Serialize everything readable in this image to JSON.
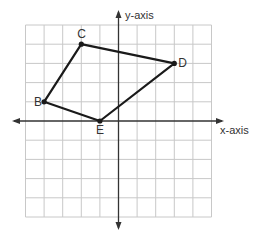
{
  "diagram": {
    "type": "coordinate-plane-polygon",
    "grid": {
      "x_min": -5,
      "x_max": 5,
      "y_min": -5,
      "y_max": 5,
      "step": 1
    },
    "axes": {
      "x_label": "x-axis",
      "y_label": "y-axis"
    },
    "points": [
      {
        "name": "C",
        "x": -2,
        "y": 4
      },
      {
        "name": "D",
        "x": 3,
        "y": 3
      },
      {
        "name": "E",
        "x": -1,
        "y": 0
      },
      {
        "name": "B",
        "x": -4,
        "y": 1
      }
    ],
    "polygon_order": [
      "C",
      "D",
      "E",
      "B"
    ],
    "colors": {
      "grid": "#c8c8c8",
      "axis": "#333333",
      "polygon": "#1a1a1a"
    }
  }
}
